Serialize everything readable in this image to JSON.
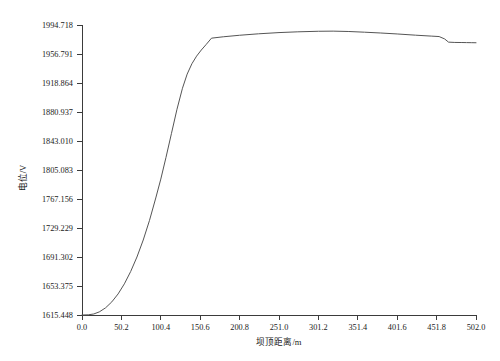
{
  "chart_data": {
    "type": "line",
    "title": "",
    "xlabel": "坝顶距离/m",
    "ylabel": "电位/V",
    "xlim": [
      0.0,
      502.0
    ],
    "ylim": [
      1615.448,
      1994.718
    ],
    "grid": false,
    "legend": null,
    "x_ticks": [
      "0.0",
      "50.2",
      "100.4",
      "150.6",
      "200.8",
      "251.0",
      "301.2",
      "351.4",
      "401.6",
      "451.8",
      "502.0"
    ],
    "x_tick_values": [
      0.0,
      50.2,
      100.4,
      150.6,
      200.8,
      251.0,
      301.2,
      351.4,
      401.6,
      451.8,
      502.0
    ],
    "y_ticks": [
      "1615.448",
      "1653.375",
      "1691.302",
      "1729.229",
      "1767.156",
      "1805.083",
      "1843.010",
      "1880.937",
      "1918.864",
      "1956.791",
      "1994.718"
    ],
    "y_tick_values": [
      1615.448,
      1653.375,
      1691.302,
      1729.229,
      1767.156,
      1805.083,
      1843.01,
      1880.937,
      1918.864,
      1956.791,
      1994.718
    ],
    "series": [
      {
        "name": "电位",
        "color": "#555555",
        "x": [
          0.0,
          8.0,
          15.0,
          22.0,
          30.0,
          38.0,
          46.0,
          54.0,
          62.0,
          70.0,
          78.0,
          86.0,
          94.0,
          100.4,
          107.0,
          114.0,
          121.0,
          128.0,
          134.0,
          140.0,
          146.0,
          152.0,
          158.0,
          165.0,
          180.0,
          200.8,
          225.0,
          251.0,
          275.0,
          301.2,
          320.0,
          340.0,
          360.0,
          380.0,
          401.6,
          425.0,
          445.0,
          455.0,
          462.0,
          467.0,
          475.0,
          484.0,
          490.0,
          496.0,
          502.0
        ],
        "y": [
          1615.448,
          1615.7,
          1616.8,
          1619.5,
          1624.8,
          1632.6,
          1643.0,
          1656.2,
          1672.3,
          1691.3,
          1713.5,
          1739.2,
          1768.5,
          1793.2,
          1821.5,
          1853.0,
          1884.5,
          1912.0,
          1930.5,
          1944.0,
          1954.0,
          1962.0,
          1969.0,
          1977.5,
          1979.3,
          1981.3,
          1983.2,
          1984.8,
          1985.8,
          1986.5,
          1986.7,
          1986.2,
          1985.3,
          1984.3,
          1983.0,
          1981.4,
          1980.2,
          1979.6,
          1976.5,
          1972.3,
          1971.9,
          1971.8,
          1971.7,
          1971.6,
          1971.5
        ]
      }
    ]
  }
}
